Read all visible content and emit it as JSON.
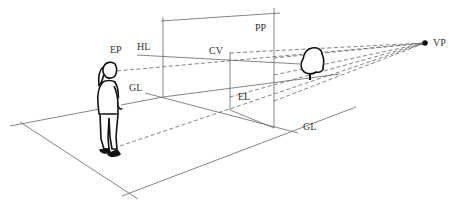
{
  "diagram": {
    "labels": {
      "ep": "EP",
      "hl": "HL",
      "cv": "CV",
      "pp": "PP",
      "gl_left": "GL",
      "el": "EL",
      "gl_right": "GL",
      "vp": "VP"
    },
    "colors": {
      "line": "#555555",
      "ink": "#111111",
      "text": "#333333"
    }
  }
}
